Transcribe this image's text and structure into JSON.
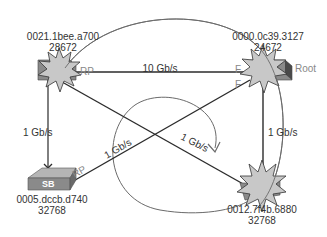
{
  "diagram": {
    "type": "spanning-tree-topology",
    "switches": [
      {
        "id": "top-left",
        "mac": "0021.1bee.a700",
        "priority": "28672",
        "role_label": "",
        "has_starburst": true
      },
      {
        "id": "top-right",
        "mac": "0000.0c39.3127",
        "priority": "24672",
        "role_label": "Root",
        "has_starburst": true
      },
      {
        "id": "bottom-left",
        "mac": "0005.dccb.d740",
        "priority": "32768",
        "role_label": "",
        "switch_label": "SB",
        "has_starburst": false
      },
      {
        "id": "bottom-right",
        "mac": "0012.7f4b.6880",
        "priority": "32768",
        "role_label": "",
        "has_starburst": true
      }
    ],
    "links": [
      {
        "from": "top-left",
        "to": "top-right",
        "speed": "10 Gb/s"
      },
      {
        "from": "top-left",
        "to": "bottom-left",
        "speed": "1 Gb/s",
        "blocked_end": "bottom-left"
      },
      {
        "from": "top-left",
        "to": "bottom-right",
        "speed": "1 Gb/s"
      },
      {
        "from": "bottom-left",
        "to": "top-right",
        "speed": "1 Gb/s"
      },
      {
        "from": "top-right",
        "to": "bottom-right",
        "speed": "1 Gb/s"
      }
    ],
    "port_labels": {
      "top_left_rp": "RP",
      "top_right_f1": "F",
      "top_right_f2": "F",
      "bottom_left_rp": "RP"
    },
    "colors": {
      "line": "#2b2b2b",
      "arc": "#6a6a6a",
      "starburst_fill": "#c8c8c8",
      "switch_body": "#8a8a8a",
      "switch_top": "#b5b5b5"
    }
  }
}
